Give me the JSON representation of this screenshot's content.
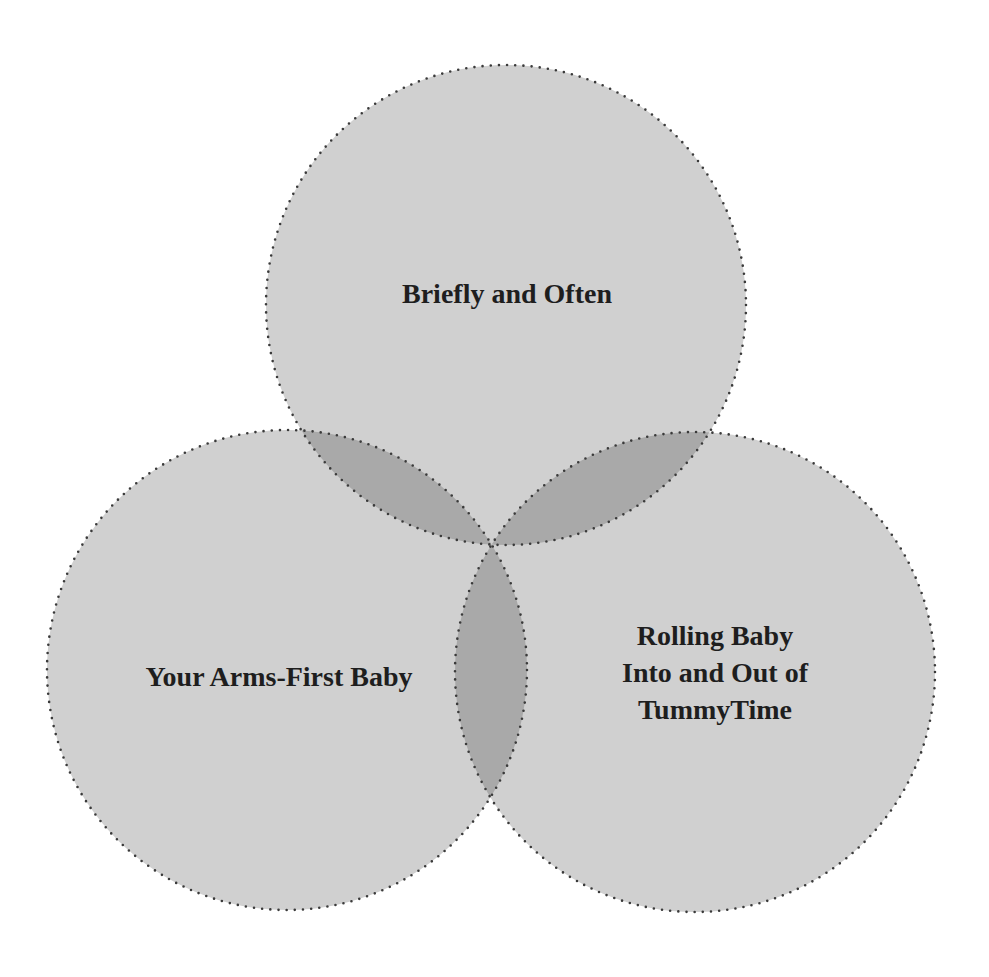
{
  "diagram": {
    "type": "venn",
    "sets": [
      {
        "id": "top",
        "label_lines": [
          "Briefly and Often"
        ],
        "center": [
          506,
          305
        ],
        "radius": 240
      },
      {
        "id": "left",
        "label_lines": [
          "Your Arms-First Baby"
        ],
        "center": [
          287,
          670
        ],
        "radius": 240
      },
      {
        "id": "right",
        "label_lines": [
          "Rolling Baby",
          "Into and Out of",
          "TummyTime"
        ],
        "center": [
          695,
          672
        ],
        "radius": 240
      }
    ],
    "colors": {
      "background": "#ffffff",
      "circle_fill": "#d0d0d0",
      "overlap_fill": "#a9a9a9",
      "outline": "#3a3a3a",
      "text": "#1e1e1e"
    }
  }
}
